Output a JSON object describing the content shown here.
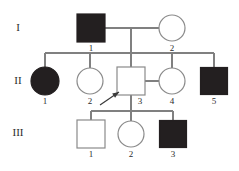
{
  "diagram": {
    "kind": "pedigree-chart",
    "background_color": "#ffffff",
    "line_color": "#808080",
    "affected_fill_color": "#231f20",
    "unaffected_fill_color": "#ffffff",
    "stroke_color": "#8a8a8a",
    "text_color": "#2b2b2b"
  },
  "generations": [
    {
      "key": "I",
      "label": "I",
      "label_x": 18,
      "label_y": 28
    },
    {
      "key": "II",
      "label": "II",
      "label_x": 18,
      "label_y": 81
    },
    {
      "key": "III",
      "label": "III",
      "label_x": 18,
      "label_y": 133
    }
  ],
  "individuals": [
    {
      "id": "I-1",
      "generation": "I",
      "number": "1",
      "sex": "male",
      "shape": "square",
      "affected": true,
      "cx": 91,
      "cy": 28,
      "size": 28,
      "label_x": 91,
      "label_y": 49
    },
    {
      "id": "I-2",
      "generation": "I",
      "number": "2",
      "sex": "female",
      "shape": "circle",
      "affected": false,
      "cx": 172,
      "cy": 28,
      "size": 26,
      "label_x": 172,
      "label_y": 49
    },
    {
      "id": "II-1",
      "generation": "II",
      "number": "1",
      "sex": "female",
      "shape": "circle",
      "affected": true,
      "cx": 45,
      "cy": 81,
      "size": 28,
      "label_x": 45,
      "label_y": 102
    },
    {
      "id": "II-2",
      "generation": "II",
      "number": "2",
      "sex": "female",
      "shape": "circle",
      "affected": false,
      "cx": 90,
      "cy": 81,
      "size": 26,
      "label_x": 90,
      "label_y": 102
    },
    {
      "id": "II-3",
      "generation": "II",
      "number": "3",
      "sex": "male",
      "shape": "square",
      "affected": false,
      "cx": 131,
      "cy": 81,
      "size": 28,
      "label_x": 140,
      "label_y": 102,
      "proband": true
    },
    {
      "id": "II-4",
      "generation": "II",
      "number": "4",
      "sex": "female",
      "shape": "circle",
      "affected": false,
      "cx": 172,
      "cy": 81,
      "size": 26,
      "label_x": 172,
      "label_y": 102
    },
    {
      "id": "II-5",
      "generation": "II",
      "number": "5",
      "sex": "male",
      "shape": "square",
      "affected": true,
      "cx": 214,
      "cy": 81,
      "size": 27,
      "label_x": 214,
      "label_y": 102
    },
    {
      "id": "III-1",
      "generation": "III",
      "number": "1",
      "sex": "male",
      "shape": "square",
      "affected": false,
      "cx": 91,
      "cy": 134,
      "size": 28,
      "label_x": 91,
      "label_y": 155
    },
    {
      "id": "III-2",
      "generation": "III",
      "number": "2",
      "sex": "female",
      "shape": "circle",
      "affected": false,
      "cx": 131,
      "cy": 134,
      "size": 26,
      "label_x": 131,
      "label_y": 155
    },
    {
      "id": "III-3",
      "generation": "III",
      "number": "3",
      "sex": "male",
      "shape": "square",
      "affected": true,
      "cx": 173,
      "cy": 134,
      "size": 27,
      "label_x": 173,
      "label_y": 155
    }
  ],
  "connections": {
    "mating_lines": [
      {
        "name": "mating-I1-I2",
        "x1": 105,
        "y1": 28,
        "x2": 159,
        "y2": 28
      },
      {
        "name": "mating-II3-II4",
        "x1": 145,
        "y1": 81,
        "x2": 159,
        "y2": 81
      }
    ],
    "descent_lines": [
      {
        "name": "descent-gen1",
        "x1": 131,
        "y1": 28,
        "x2": 131,
        "y2": 53
      },
      {
        "name": "descent-gen2",
        "x1": 131,
        "y1": 95,
        "x2": 131,
        "y2": 111
      }
    ],
    "sibship_lines": [
      {
        "name": "sibship-gen2",
        "x1": 45,
        "y1": 53,
        "x2": 214,
        "y2": 53
      },
      {
        "name": "sibship-gen3",
        "x1": 91,
        "y1": 111,
        "x2": 173,
        "y2": 111
      }
    ],
    "drop_lines": [
      {
        "name": "drop-II1",
        "x1": 45,
        "y1": 53,
        "x2": 45,
        "y2": 67
      },
      {
        "name": "drop-II2",
        "x1": 90,
        "y1": 53,
        "x2": 90,
        "y2": 68
      },
      {
        "name": "drop-II3",
        "x1": 131,
        "y1": 53,
        "x2": 131,
        "y2": 67
      },
      {
        "name": "drop-II4",
        "x1": 172,
        "y1": 53,
        "x2": 172,
        "y2": 68
      },
      {
        "name": "drop-II5",
        "x1": 214,
        "y1": 53,
        "x2": 214,
        "y2": 67
      },
      {
        "name": "drop-III1",
        "x1": 91,
        "y1": 111,
        "x2": 91,
        "y2": 120
      },
      {
        "name": "drop-III2",
        "x1": 131,
        "y1": 111,
        "x2": 131,
        "y2": 121
      },
      {
        "name": "drop-III3",
        "x1": 173,
        "y1": 111,
        "x2": 173,
        "y2": 120
      }
    ]
  },
  "proband_arrow": {
    "name": "proband-arrow",
    "points_to": "II-3",
    "x1": 100,
    "y1": 105,
    "x2": 119,
    "y2": 92
  }
}
